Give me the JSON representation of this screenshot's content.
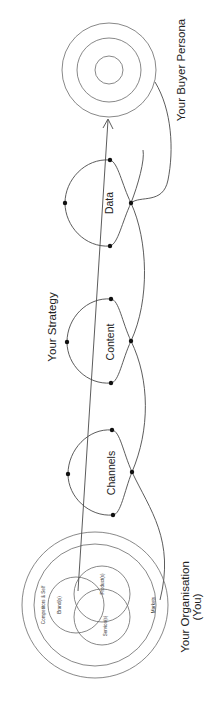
{
  "diagram": {
    "title_labels": {
      "buyer_persona": "Your Buyer Persona",
      "strategy": "Your Strategy",
      "organisation_line1": "Your Organisation",
      "organisation_line2": "(You)"
    },
    "loops": [
      {
        "id": "data",
        "label": "Data"
      },
      {
        "id": "content",
        "label": "Content"
      },
      {
        "id": "channels",
        "label": "Channels"
      }
    ],
    "organisation": {
      "rings": {
        "outer": "Markets",
        "inner": "Competitors & Self"
      },
      "venn": [
        {
          "id": "brands",
          "label": "Brand(s)"
        },
        {
          "id": "products",
          "label": "Product(s)"
        },
        {
          "id": "services",
          "label": "Service(s)"
        }
      ]
    },
    "colors": {
      "stroke": "#4a4a4a",
      "dot": "#111111",
      "text": "#222222",
      "background": "#ffffff"
    }
  }
}
